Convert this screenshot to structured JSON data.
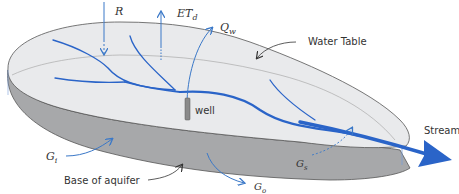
{
  "diagram": {
    "colors": {
      "top_surface": "#e9eaec",
      "side_surface": "#a7a8aa",
      "outline": "#555555",
      "water_blue": "#2a64c8",
      "arrow_blue": "#3a78c8",
      "well": "#8a8a8a",
      "text": "#333333"
    },
    "labels": {
      "recharge": "R",
      "evapotranspiration_main": "ET",
      "evapotranspiration_sub": "d",
      "well_pumping_main": "Q",
      "well_pumping_sub": "w",
      "water_table": "Water Table",
      "well": "well",
      "stream": "Stream",
      "groundwater_inflow_main": "G",
      "groundwater_inflow_sub": "i",
      "groundwater_to_stream_main": "G",
      "groundwater_to_stream_sub": "s",
      "groundwater_outflow_main": "G",
      "groundwater_outflow_sub": "o",
      "base_of_aquifer": "Base of aquifer"
    }
  }
}
